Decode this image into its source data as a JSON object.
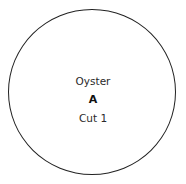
{
  "diagram": {
    "shape": "circle",
    "lines": [
      "Oyster",
      "A",
      "Cut 1"
    ],
    "stroke_color": "#222222"
  }
}
